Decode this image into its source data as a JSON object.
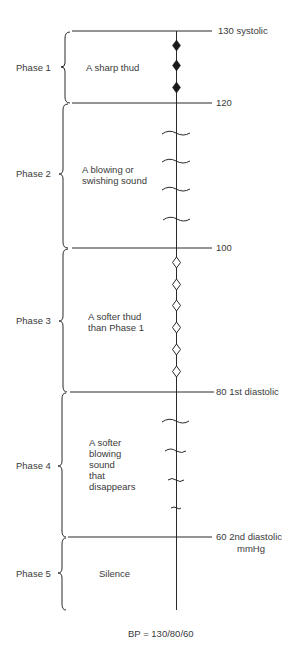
{
  "axis": {
    "unit": "mmHg"
  },
  "pressure_marks": [
    {
      "value": "130",
      "label": "130 systolic"
    },
    {
      "value": "120",
      "label": "120"
    },
    {
      "value": "100",
      "label": "100"
    },
    {
      "value": "80",
      "label": "80 1st diastolic"
    },
    {
      "value": "60",
      "label": "60 2nd diastolic"
    }
  ],
  "unit_label": "mmHg",
  "phases": [
    {
      "name": "Phase 1",
      "description": "A sharp thud",
      "marker": "filled-diamond"
    },
    {
      "name": "Phase 2",
      "description": "A blowing or swishing sound",
      "marker": "wave"
    },
    {
      "name": "Phase 3",
      "description": "A softer thud than Phase 1",
      "marker": "open-diamond"
    },
    {
      "name": "Phase 4",
      "description": "A softer blowing sound that disappears",
      "marker": "fading-wave"
    },
    {
      "name": "Phase 5",
      "description": "Silence",
      "marker": "none"
    }
  ],
  "phase_desc_lines": {
    "p1": [
      "A sharp thud"
    ],
    "p2": [
      "A blowing or",
      "swishing sound"
    ],
    "p3": [
      "A softer thud",
      "than Phase 1"
    ],
    "p4": [
      "A softer",
      "blowing",
      "sound",
      "that",
      "disappears"
    ],
    "p5": [
      "Silence"
    ]
  },
  "footer": "BP = 130/80/60",
  "colors": {
    "line": "#2a2a2a",
    "text": "#3a3a3a",
    "background": "#ffffff"
  }
}
